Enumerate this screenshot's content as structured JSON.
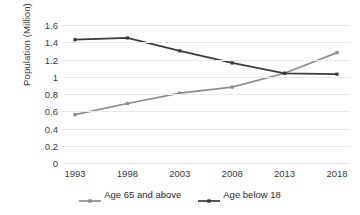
{
  "chart_data": {
    "type": "line",
    "title": "",
    "xlabel": "",
    "ylabel": "Population (Million)",
    "categories": [
      "1993",
      "1998",
      "2003",
      "2008",
      "2013",
      "2018"
    ],
    "x": [
      1993,
      1998,
      2003,
      2008,
      2013,
      2018
    ],
    "series": [
      {
        "name": "Age 65 and above",
        "color": "#8c8c8c",
        "marker": "square",
        "values": [
          0.56,
          0.69,
          0.81,
          0.88,
          1.04,
          1.28
        ]
      },
      {
        "name": "Age below 18",
        "color": "#3b3b3b",
        "marker": "square",
        "values": [
          1.43,
          1.45,
          1.3,
          1.16,
          1.04,
          1.03
        ]
      }
    ],
    "ylim": [
      0,
      1.6
    ],
    "ytick_step": 0.2,
    "ytick_labels": [
      "0",
      "0.2",
      "0.4",
      "0.6",
      "0.8",
      "1",
      "1.2",
      "1.4",
      "1.6"
    ],
    "ytick_values": [
      0,
      0.2,
      0.4,
      0.6,
      0.8,
      1,
      1.2,
      1.4,
      1.6
    ],
    "grid": "horizontal",
    "grid_color": "#e9e9e9",
    "legend_position": "bottom",
    "background": "#ffffff"
  },
  "axis": {
    "y_title": "Population (Million)"
  },
  "legend": {
    "items": [
      {
        "label": "Age 65 and above",
        "color": "#8c8c8c"
      },
      {
        "label": "Age below 18",
        "color": "#3b3b3b"
      }
    ]
  }
}
